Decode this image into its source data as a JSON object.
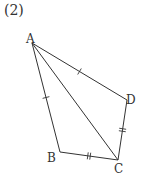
{
  "figure": {
    "label": "(2)",
    "vertices": {
      "A": "A",
      "B": "B",
      "C": "C",
      "D": "D"
    },
    "edges": [
      {
        "from": "A",
        "to": "B",
        "ticks": 1
      },
      {
        "from": "B",
        "to": "C",
        "ticks": 2
      },
      {
        "from": "C",
        "to": "D",
        "ticks": 2
      },
      {
        "from": "D",
        "to": "A",
        "ticks": 1
      },
      {
        "from": "A",
        "to": "C",
        "ticks": 0
      }
    ]
  }
}
